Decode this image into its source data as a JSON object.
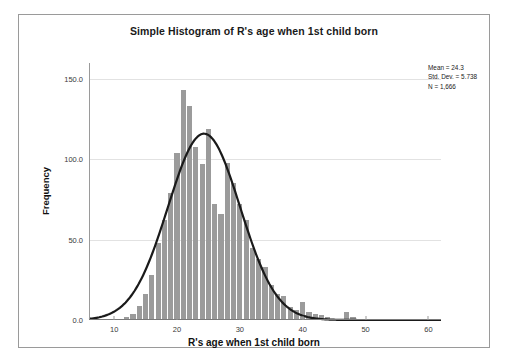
{
  "chart_data": {
    "type": "bar",
    "title": "Simple Histogram of R's age when 1st child born",
    "xlabel": "R's age when 1st child born",
    "ylabel": "Frequency",
    "xlim": [
      6,
      62
    ],
    "ylim": [
      0,
      160
    ],
    "grid": true,
    "bar_color": "#9b9b9b",
    "curve_color": "#1a1a1a",
    "xticks": [
      10,
      20,
      30,
      40,
      50,
      60
    ],
    "xtick_labels": [
      "10",
      "20",
      "30",
      "40",
      "50",
      "60"
    ],
    "yticks": [
      0,
      50,
      100,
      150
    ],
    "ytick_labels": [
      "0.0",
      "50.0",
      "100.0",
      "150.0"
    ],
    "bin_width": 1,
    "categories": [
      12,
      13,
      14,
      15,
      16,
      17,
      18,
      19,
      20,
      21,
      22,
      23,
      24,
      25,
      26,
      27,
      28,
      29,
      30,
      31,
      32,
      33,
      34,
      35,
      36,
      37,
      38,
      39,
      40,
      41,
      42,
      43,
      44,
      47,
      48
    ],
    "values": [
      2,
      4,
      9,
      16,
      28,
      48,
      62,
      79,
      104,
      143,
      133,
      108,
      97,
      119,
      72,
      66,
      98,
      85,
      72,
      62,
      45,
      38,
      33,
      22,
      16,
      15,
      8,
      6,
      11,
      5,
      4,
      3,
      2,
      5,
      2
    ],
    "overlay": {
      "name": "normal-curve",
      "mean": 24.3,
      "std_dev": 5.738,
      "peak_frequency": 116
    },
    "annotations": {
      "mean_label": "Mean = 24.3",
      "std_label": "Std. Dev. = 5.738",
      "n_label": "N = 1,666"
    }
  }
}
